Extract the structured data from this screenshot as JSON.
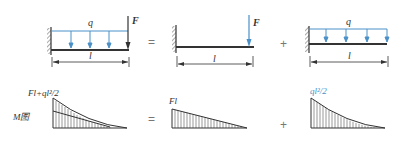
{
  "colors": {
    "beam": "#333333",
    "load": "#4a90c8",
    "text_dark": "#333333",
    "text_blue": "#4a90c8",
    "hatch": "#444444",
    "background": "#ffffff"
  },
  "top_row": {
    "panel1": {
      "load_label": "q",
      "force_label": "F",
      "length_label": "l"
    },
    "op1": "=",
    "panel2": {
      "force_label": "F",
      "length_label": "l"
    },
    "op2": "+",
    "panel3": {
      "load_label": "q",
      "length_label": "l"
    }
  },
  "bottom_row": {
    "diagram_label": "M图",
    "panel1": {
      "value_label": "Fl+ql²/2"
    },
    "op1": "=",
    "panel2": {
      "value_label": "Fl"
    },
    "op2": "+",
    "panel3": {
      "value_label": "ql²/2"
    }
  }
}
